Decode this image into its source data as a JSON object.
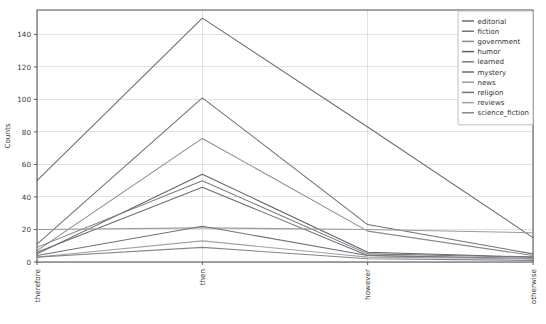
{
  "chart_data": {
    "type": "line",
    "title": "",
    "xlabel": "",
    "ylabel": "Counts",
    "categories": [
      "therefore",
      "then",
      "however",
      "otherwise"
    ],
    "ylim": [
      0,
      155
    ],
    "yticks": [
      0,
      20,
      40,
      60,
      80,
      100,
      120,
      140
    ],
    "grid": true,
    "legend_position": "upper right",
    "series": [
      {
        "name": "editorial",
        "color": "#6b6b73",
        "values": [
          50,
          150,
          83,
          15
        ]
      },
      {
        "name": "fiction",
        "color": "#707078",
        "values": [
          11,
          101,
          23,
          5
        ]
      },
      {
        "name": "government",
        "color": "#8a8a92",
        "values": [
          7,
          76,
          19,
          4
        ]
      },
      {
        "name": "humor",
        "color": "#5f5f67",
        "values": [
          5,
          54,
          6,
          3
        ]
      },
      {
        "name": "learned",
        "color": "#797981",
        "values": [
          9,
          50,
          5,
          3
        ]
      },
      {
        "name": "mystery",
        "color": "#6d6d75",
        "values": [
          6,
          46,
          4,
          2
        ]
      },
      {
        "name": "news",
        "color": "#9a9aa2",
        "values": [
          20,
          21,
          20,
          18
        ]
      },
      {
        "name": "religion",
        "color": "#73737b",
        "values": [
          4,
          22,
          4,
          2
        ]
      },
      {
        "name": "reviews",
        "color": "#a2a2aa",
        "values": [
          3,
          13,
          3,
          2
        ]
      },
      {
        "name": "science_fiction",
        "color": "#858590",
        "values": [
          3,
          9,
          2,
          1
        ]
      }
    ]
  },
  "axes": {
    "ylabel": "Counts",
    "ytick_labels": [
      "0",
      "20",
      "40",
      "60",
      "80",
      "100",
      "120",
      "140"
    ],
    "xtick_labels": [
      "therefore",
      "then",
      "however",
      "otherwise"
    ]
  },
  "legend": {
    "entries": [
      "editorial",
      "fiction",
      "government",
      "humor",
      "learned",
      "mystery",
      "news",
      "religion",
      "reviews",
      "science_fiction"
    ]
  }
}
